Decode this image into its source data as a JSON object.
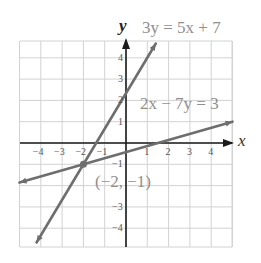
{
  "chart_data": {
    "type": "line",
    "title": "",
    "xlabel": "x",
    "ylabel": "y",
    "xlim": [
      -5,
      5
    ],
    "ylim": [
      -5,
      5
    ],
    "grid": true,
    "x_ticks": [
      "-4",
      "-3",
      "-2",
      "-1",
      "1",
      "2",
      "3",
      "4"
    ],
    "y_ticks": [
      "4",
      "3",
      "2",
      "1",
      "-1",
      "-3",
      "-4"
    ],
    "series": [
      {
        "name": "3y = 5x + 7",
        "equation": "3y = 5x + 7",
        "slope": 1.6667,
        "intercept": 2.3333,
        "x": [
          -4.2,
          1.4
        ],
        "y": [
          -4.67,
          4.67
        ],
        "color": "#6e6e6e"
      },
      {
        "name": "2x − 7y = 3",
        "equation": "2x − 7y = 3",
        "slope": 0.2857,
        "intercept": -0.4286,
        "x": [
          -5,
          5
        ],
        "y": [
          -1.86,
          1.0
        ],
        "color": "#6e6e6e"
      }
    ],
    "annotations": [
      {
        "text": "(−2, −1)",
        "x": -2,
        "y": -1,
        "type": "intersection-point"
      }
    ]
  },
  "labels": {
    "y_axis": "y",
    "x_axis": "x",
    "eq1": "3y = 5x + 7",
    "eq2": "2x − 7y = 3",
    "point": "(−2, −1)",
    "ticks_x": [
      "−4",
      "−3",
      "−2",
      "−1",
      "1",
      "2",
      "3",
      "4"
    ],
    "ticks_y": [
      "4",
      "3",
      "2",
      "1",
      "−1",
      "−3",
      "−4"
    ]
  },
  "colors": {
    "grid": "#d0d0d0",
    "axis": "#1a1a1a",
    "line": "#6e6e6e",
    "text": "#8f8f8f"
  }
}
